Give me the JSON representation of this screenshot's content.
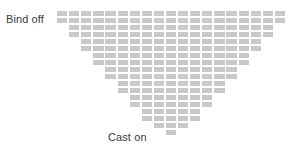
{
  "labels": {
    "bind_off": "Bind off",
    "cast_on": "Cast on"
  },
  "colors": {
    "stitch": "#c9c9c9",
    "background": "#ffffff",
    "text": "#3a3a3a"
  },
  "chart_data": {
    "type": "heatmap",
    "title": "",
    "subtitle": "",
    "xlabel": "",
    "ylabel": "",
    "grid": false,
    "legend": false,
    "columns": 19,
    "rows": 18,
    "annotations": [
      {
        "text": "Bind off",
        "position": "top-left"
      },
      {
        "text": "Cast on",
        "position": "bottom-center"
      }
    ],
    "row_stitch_counts": [
      19,
      19,
      17,
      17,
      15,
      15,
      13,
      13,
      11,
      11,
      9,
      9,
      7,
      7,
      5,
      5,
      3,
      1
    ],
    "row_start_offsets": [
      0,
      0,
      1,
      1,
      2,
      2,
      3,
      3,
      4,
      4,
      5,
      5,
      6,
      6,
      7,
      7,
      8,
      9
    ],
    "rows_data": [
      {
        "index": 1,
        "count": 19,
        "offset": 0
      },
      {
        "index": 2,
        "count": 19,
        "offset": 0
      },
      {
        "index": 3,
        "count": 17,
        "offset": 1
      },
      {
        "index": 4,
        "count": 17,
        "offset": 1
      },
      {
        "index": 5,
        "count": 15,
        "offset": 2
      },
      {
        "index": 6,
        "count": 15,
        "offset": 2
      },
      {
        "index": 7,
        "count": 13,
        "offset": 3
      },
      {
        "index": 8,
        "count": 13,
        "offset": 3
      },
      {
        "index": 9,
        "count": 11,
        "offset": 4
      },
      {
        "index": 10,
        "count": 11,
        "offset": 4
      },
      {
        "index": 11,
        "count": 9,
        "offset": 5
      },
      {
        "index": 12,
        "count": 9,
        "offset": 5
      },
      {
        "index": 13,
        "count": 7,
        "offset": 6
      },
      {
        "index": 14,
        "count": 7,
        "offset": 6
      },
      {
        "index": 15,
        "count": 5,
        "offset": 7
      },
      {
        "index": 16,
        "count": 5,
        "offset": 7
      },
      {
        "index": 17,
        "count": 3,
        "offset": 8
      },
      {
        "index": 18,
        "count": 1,
        "offset": 9
      }
    ],
    "geometry": {
      "cell_width": 12.1,
      "cell_height": 7.0,
      "cell_fill_width": 10.3,
      "cell_fill_height": 5.0,
      "grid_left": 57,
      "grid_top": 11
    }
  }
}
